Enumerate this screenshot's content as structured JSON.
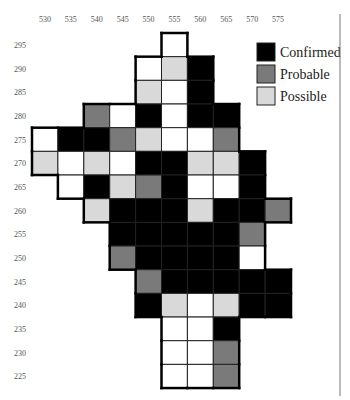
{
  "chart_data": {
    "type": "heatmap",
    "title": "",
    "x_ticks": [
      530,
      535,
      540,
      545,
      550,
      555,
      560,
      565,
      570,
      575
    ],
    "y_ticks": [
      295,
      290,
      285,
      280,
      275,
      270,
      265,
      260,
      255,
      250,
      245,
      240,
      235,
      230,
      225
    ],
    "categories": {
      "C": {
        "label": "Confirmed",
        "color": "#000000"
      },
      "P": {
        "label": "Probable",
        "color": "#7a7a7a"
      },
      "S": {
        "label": "Possible",
        "color": "#d9d9d9"
      },
      "W": {
        "label": "",
        "color": "#ffffff"
      }
    },
    "legend": [
      {
        "key": "C",
        "label": "Confirmed"
      },
      {
        "key": "P",
        "label": "Probable"
      },
      {
        "key": "S",
        "label": "Possible"
      }
    ],
    "legend_position": "top-right",
    "rows": [
      {
        "y": 295,
        "cells": {
          "555": "W"
        }
      },
      {
        "y": 290,
        "cells": {
          "550": "W",
          "555": "S",
          "560": "C"
        }
      },
      {
        "y": 285,
        "cells": {
          "550": "S",
          "555": "W",
          "560": "C"
        }
      },
      {
        "y": 280,
        "cells": {
          "540": "P",
          "545": "W",
          "550": "C",
          "555": "W",
          "560": "C",
          "565": "C"
        }
      },
      {
        "y": 275,
        "cells": {
          "530": "W",
          "535": "C",
          "540": "C",
          "545": "P",
          "550": "S",
          "555": "W",
          "560": "W",
          "565": "P"
        }
      },
      {
        "y": 270,
        "cells": {
          "530": "S",
          "535": "W",
          "540": "S",
          "545": "W",
          "550": "C",
          "555": "C",
          "560": "S",
          "565": "S",
          "570": "C"
        }
      },
      {
        "y": 265,
        "cells": {
          "535": "W",
          "540": "C",
          "545": "S",
          "550": "P",
          "555": "C",
          "560": "W",
          "565": "W",
          "570": "C"
        }
      },
      {
        "y": 260,
        "cells": {
          "540": "S",
          "545": "C",
          "550": "C",
          "555": "C",
          "560": "S",
          "565": "C",
          "570": "C",
          "575": "P"
        }
      },
      {
        "y": 255,
        "cells": {
          "545": "C",
          "550": "C",
          "555": "C",
          "560": "C",
          "565": "C",
          "570": "P"
        }
      },
      {
        "y": 250,
        "cells": {
          "545": "P",
          "550": "C",
          "555": "C",
          "560": "C",
          "565": "C",
          "570": "W"
        }
      },
      {
        "y": 245,
        "cells": {
          "550": "P",
          "555": "C",
          "560": "C",
          "565": "C",
          "570": "C",
          "575": "C"
        }
      },
      {
        "y": 240,
        "cells": {
          "550": "C",
          "555": "S",
          "560": "W",
          "565": "S",
          "570": "C",
          "575": "C"
        }
      },
      {
        "y": 235,
        "cells": {
          "555": "W",
          "560": "W",
          "565": "C"
        }
      },
      {
        "y": 230,
        "cells": {
          "555": "W",
          "560": "W",
          "565": "P"
        }
      },
      {
        "y": 225,
        "cells": {
          "555": "W",
          "560": "W",
          "565": "P"
        }
      }
    ]
  }
}
